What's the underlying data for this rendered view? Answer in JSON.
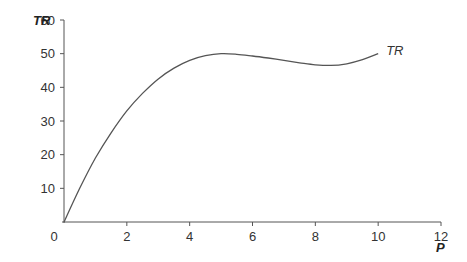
{
  "chart_data": {
    "type": "line",
    "title": "",
    "xlabel": "P",
    "ylabel": "TR",
    "xlim": [
      0,
      12
    ],
    "ylim": [
      0,
      60
    ],
    "x_ticks": [
      0,
      2,
      4,
      6,
      8,
      10,
      12
    ],
    "y_ticks": [
      10,
      20,
      30,
      40,
      50,
      60
    ],
    "grid": false,
    "legend": "inline label at end of curve",
    "series": [
      {
        "name": "TR",
        "x": [
          0,
          0.5,
          1,
          1.5,
          2,
          2.5,
          3,
          3.5,
          4,
          4.5,
          5,
          5.5,
          6,
          6.5,
          7,
          7.5,
          8,
          8.5,
          9,
          9.5,
          10
        ],
        "values": [
          0,
          10,
          19,
          26.5,
          33,
          38.2,
          42.5,
          45.7,
          48,
          49.4,
          50,
          49.8,
          49.3,
          48.7,
          48,
          47.3,
          46.7,
          46.5,
          47,
          48.2,
          50
        ]
      }
    ]
  },
  "axes": {
    "y_title": "TR",
    "x_title": "P",
    "y_tick_labels": [
      "60",
      "50",
      "40",
      "30",
      "20",
      "10"
    ],
    "x_tick_labels": [
      "0",
      "2",
      "4",
      "6",
      "8",
      "10",
      "12"
    ]
  },
  "series_label": "TR",
  "colors": {
    "axis": "#555555",
    "curve": "#555555",
    "text": "#333333"
  }
}
